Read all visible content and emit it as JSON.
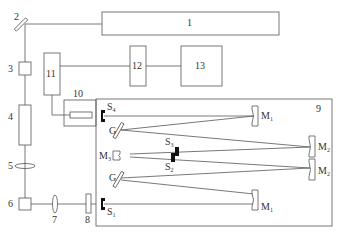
{
  "diagram": {
    "type": "optical setup schematic",
    "components": [
      {
        "id": "1",
        "label": "1",
        "shape": "rectangle"
      },
      {
        "id": "2",
        "label": "2",
        "shape": "tilted mirror"
      },
      {
        "id": "3",
        "label": "3",
        "shape": "small box"
      },
      {
        "id": "4",
        "label": "4",
        "shape": "tall box"
      },
      {
        "id": "5",
        "label": "5",
        "shape": "lens"
      },
      {
        "id": "6",
        "label": "6",
        "shape": "small box"
      },
      {
        "id": "7",
        "label": "7",
        "shape": "lens"
      },
      {
        "id": "8",
        "label": "8",
        "shape": "plate"
      },
      {
        "id": "9",
        "label": "9",
        "shape": "enclosure"
      },
      {
        "id": "10",
        "label": "10",
        "shape": "box with inner element"
      },
      {
        "id": "11",
        "label": "11",
        "shape": "tall box"
      },
      {
        "id": "12",
        "label": "12",
        "shape": "box"
      },
      {
        "id": "13",
        "label": "13",
        "shape": "box"
      }
    ],
    "inner_labels": {
      "s4": {
        "base": "S",
        "sub": "4"
      },
      "s3": {
        "base": "S",
        "sub": "3"
      },
      "s2": {
        "base": "S",
        "sub": "2"
      },
      "s1": {
        "base": "S",
        "sub": "1"
      },
      "g_top": {
        "base": "G",
        "sub": ""
      },
      "g_bottom": {
        "base": "G",
        "sub": ""
      },
      "m3": {
        "base": "M",
        "sub": "3"
      },
      "m1_top": {
        "base": "M",
        "sub": "1"
      },
      "m1_bottom": {
        "base": "M",
        "sub": "1"
      },
      "m2_top": {
        "base": "M",
        "sub": "2"
      },
      "m2_bottom": {
        "base": "M",
        "sub": "2"
      }
    }
  }
}
